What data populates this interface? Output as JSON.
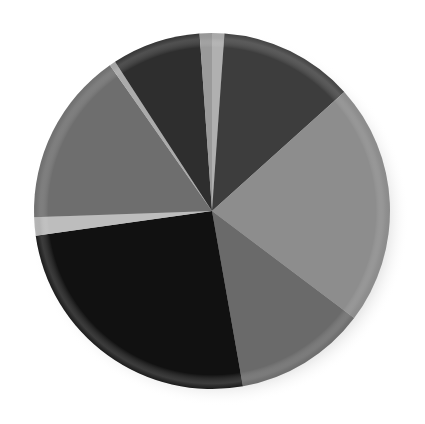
{
  "chart_data": {
    "type": "pie",
    "title": "",
    "subtitle": "",
    "xlabel": "",
    "ylabel": "",
    "grid": false,
    "legend_position": "none",
    "labels_shown": false,
    "center_x": 212,
    "center_y": 211,
    "radius": 178,
    "start_angle_deg": 0,
    "direction": "clockwise",
    "total": 100,
    "categories": [
      "Slice 1",
      "Slice 2",
      "Slice 3",
      "Slice 4",
      "Slice 5",
      "Slice 6",
      "Slice 7",
      "Slice 8",
      "Slice 9",
      "Slice 10"
    ],
    "values": [
      1.1,
      12.2,
      22.0,
      11.9,
      25.6,
      1.7,
      15.8,
      0.6,
      8.1,
      1.0
    ],
    "angles_deg": [
      4.0,
      44.0,
      79.0,
      43.0,
      92.0,
      6.0,
      57.0,
      2.0,
      29.0,
      4.0
    ],
    "colors": [
      "#b0b0b0",
      "#3d3d3d",
      "#8d8d8d",
      "#6a6a6a",
      "#111111",
      "#bdbdbd",
      "#6e6e6e",
      "#ababab",
      "#2e2e2e",
      "#9a9a9a"
    ],
    "slices": [
      {
        "label": "Slice 1",
        "value": 1.1,
        "angle_deg": 4.0,
        "start_deg": 0.0,
        "end_deg": 4.0,
        "color": "#b0b0b0"
      },
      {
        "label": "Slice 2",
        "value": 12.2,
        "angle_deg": 44.0,
        "start_deg": 4.0,
        "end_deg": 48.0,
        "color": "#3d3d3d"
      },
      {
        "label": "Slice 3",
        "value": 22.0,
        "angle_deg": 79.0,
        "start_deg": 48.0,
        "end_deg": 127.0,
        "color": "#8d8d8d"
      },
      {
        "label": "Slice 4",
        "value": 11.9,
        "angle_deg": 43.0,
        "start_deg": 127.0,
        "end_deg": 170.0,
        "color": "#6a6a6a"
      },
      {
        "label": "Slice 5",
        "value": 25.6,
        "angle_deg": 92.0,
        "start_deg": 170.0,
        "end_deg": 262.0,
        "color": "#111111"
      },
      {
        "label": "Slice 6",
        "value": 1.7,
        "angle_deg": 6.0,
        "start_deg": 262.0,
        "end_deg": 268.0,
        "color": "#bdbdbd"
      },
      {
        "label": "Slice 7",
        "value": 15.8,
        "angle_deg": 57.0,
        "start_deg": 268.0,
        "end_deg": 325.0,
        "color": "#6e6e6e"
      },
      {
        "label": "Slice 8",
        "value": 0.6,
        "angle_deg": 2.0,
        "start_deg": 325.0,
        "end_deg": 327.0,
        "color": "#ababab"
      },
      {
        "label": "Slice 9",
        "value": 8.1,
        "angle_deg": 29.0,
        "start_deg": 327.0,
        "end_deg": 356.0,
        "color": "#2e2e2e"
      },
      {
        "label": "Slice 10",
        "value": 1.0,
        "angle_deg": 4.0,
        "start_deg": 356.0,
        "end_deg": 360.0,
        "color": "#9a9a9a"
      }
    ],
    "background_color": "#ffffff",
    "shadow_color": "#c9c9c9"
  }
}
